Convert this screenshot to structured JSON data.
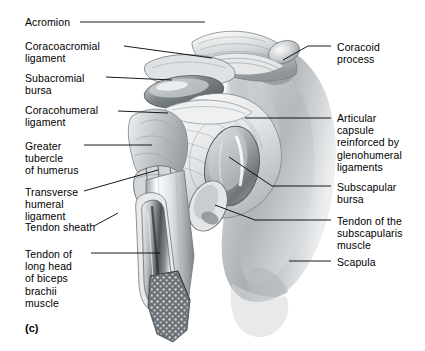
{
  "figure": {
    "panel_label": "(c)",
    "background": "#ffffff",
    "ink": "#000000"
  },
  "labels_left": [
    {
      "name": "acromion",
      "text": "Acromion",
      "x": 25,
      "y": 16,
      "line": [
        [
          80,
          22
        ],
        [
          205,
          22
        ]
      ]
    },
    {
      "name": "coracoacromial-ligament",
      "text": "Coracoacromial\nligament",
      "x": 25,
      "y": 40,
      "line": [
        [
          124,
          46
        ],
        [
          212,
          58
        ]
      ]
    },
    {
      "name": "subacromial-bursa",
      "text": "Subacromial\nbursa",
      "x": 25,
      "y": 72,
      "line": [
        [
          106,
          77
        ],
        [
          172,
          80
        ]
      ]
    },
    {
      "name": "coracohumeral-ligament",
      "text": "Coracohumeral\nligament",
      "x": 25,
      "y": 104,
      "line": [
        [
          118,
          111
        ],
        [
          168,
          113
        ]
      ]
    },
    {
      "name": "greater-tubercle-of-humerus",
      "text": "Greater\ntubercle\nof humerus",
      "x": 25,
      "y": 140,
      "line": [
        [
          84,
          145
        ],
        [
          152,
          145
        ]
      ]
    },
    {
      "name": "transverse-humeral-ligament",
      "text": "Transverse\nhumeral\nligament",
      "x": 25,
      "y": 186,
      "line": [
        [
          84,
          191
        ],
        [
          158,
          170
        ]
      ]
    },
    {
      "name": "tendon-sheath",
      "text": "Tendon sheath",
      "x": 25,
      "y": 221,
      "line": [
        [
          94,
          226
        ],
        [
          118,
          213
        ]
      ]
    },
    {
      "name": "tendon-of-long-head-of-biceps-brachii",
      "text": "Tendon of\nlong head\nof biceps\nbrachii\nmuscle",
      "x": 25,
      "y": 248,
      "line": [
        [
          91,
          253
        ],
        [
          160,
          253
        ]
      ]
    }
  ],
  "labels_right": [
    {
      "name": "coracoid-process",
      "text": "Coracoid\nprocess",
      "x": 337,
      "y": 41,
      "line": [
        [
          283,
          60
        ],
        [
          308,
          46
        ],
        [
          331,
          46
        ]
      ]
    },
    {
      "name": "articular-capsule",
      "text": "Articular\ncapsule\nreinforced by\nglenohumeral\nligaments",
      "x": 337,
      "y": 112,
      "line": [
        [
          245,
          118
        ],
        [
          331,
          118
        ]
      ]
    },
    {
      "name": "subscapular-bursa",
      "text": "Subscapular\nbursa",
      "x": 337,
      "y": 181,
      "line": [
        [
          229,
          157
        ],
        [
          272,
          186
        ],
        [
          331,
          186
        ]
      ]
    },
    {
      "name": "tendon-of-subscapularis",
      "text": "Tendon of the\nsubscapularis\nmuscle",
      "x": 337,
      "y": 215,
      "line": [
        [
          215,
          205
        ],
        [
          255,
          220
        ],
        [
          331,
          220
        ]
      ]
    },
    {
      "name": "scapula",
      "text": "Scapula",
      "x": 337,
      "y": 256,
      "line": [
        [
          289,
          261
        ],
        [
          331,
          261
        ]
      ]
    }
  ],
  "structures": [
    {
      "name": "scapula-body",
      "tone": "#b9bcbf"
    },
    {
      "name": "acromion",
      "tone": "#d9dcde"
    },
    {
      "name": "coracoid-process",
      "tone": "#cfd2d5"
    },
    {
      "name": "articular-capsule",
      "tone": "#e6e8ea"
    },
    {
      "name": "subacromial-bursa",
      "tone": "#9aa0a5"
    },
    {
      "name": "subscapular-bursa",
      "tone": "#8e9499"
    },
    {
      "name": "humerus-shaft",
      "tone": "#dfe2e4"
    },
    {
      "name": "biceps-tendon",
      "tone": "#63696e"
    },
    {
      "name": "trabecular-bone",
      "tone": "#6d7378"
    }
  ]
}
